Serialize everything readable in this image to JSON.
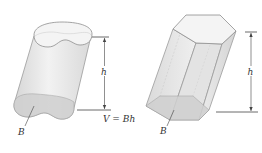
{
  "figure": {
    "formula": "V = Bh",
    "left_solid": {
      "type": "oblique cylinder",
      "height_label": "h",
      "base_label": "B"
    },
    "right_solid": {
      "type": "oblique hexagonal prism",
      "height_label": "h",
      "base_label": "B"
    },
    "colors": {
      "solid_fill": "#e6e6e6",
      "solid_edge": "#9a9a9a",
      "base_fill": "#d2d2d2",
      "top_fill": "#f3f3f3",
      "line": "#444444"
    }
  }
}
